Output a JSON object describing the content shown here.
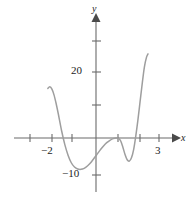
{
  "figure": {
    "name": "polynomial-graph",
    "background_color": "#ffffff"
  },
  "axes": {
    "x_axis": {
      "label": "x",
      "color": "#6b6b6b",
      "arrow": "right-arrow-icon"
    },
    "y_axis": {
      "label": "y",
      "color": "#6b6b6b",
      "arrow": "up-arrow-icon"
    },
    "origin_px": {
      "x": 96,
      "y": 138
    },
    "x_unit_px": 21.5,
    "y_unit_px": 3.3
  },
  "ticks": {
    "x": [
      {
        "value": -3,
        "label": "",
        "px": 30
      },
      {
        "value": -2,
        "label": "−2",
        "px": 52
      },
      {
        "value": -1,
        "label": "",
        "px": 72
      },
      {
        "value": 1,
        "label": "",
        "px": 118
      },
      {
        "value": 2,
        "label": "",
        "px": 140
      },
      {
        "value": 3,
        "label": "3",
        "px": 159
      }
    ],
    "y": [
      {
        "value": 30,
        "label": "",
        "px": 41
      },
      {
        "value": 20,
        "label": "20",
        "px": 72
      },
      {
        "value": 10,
        "label": "",
        "px": 105
      },
      {
        "value": -10,
        "label": "−10",
        "px": 175
      }
    ]
  },
  "labels": {
    "x_neg2": "−2",
    "x_3": "3",
    "y_20": "20",
    "y_neg10": "−10",
    "axis_x": "x",
    "axis_y": "y"
  },
  "chart_data": {
    "type": "line",
    "title": "",
    "xlabel": "x",
    "ylabel": "y",
    "xlim": [
      -2.3,
      2.5
    ],
    "ylim": [
      -12,
      28
    ],
    "grid": false,
    "legend": null,
    "curve_color": "#9e9e9e",
    "series": [
      {
        "name": "polynomial",
        "x": [
          -2.24,
          -2.15,
          -2.05,
          -1.95,
          -1.85,
          -1.75,
          -1.6,
          -1.45,
          -1.3,
          -1.15,
          -1.0,
          -0.85,
          -0.7,
          -0.55,
          -0.4,
          -0.25,
          -0.1,
          0.05,
          0.2,
          0.35,
          0.5,
          0.65,
          0.8,
          0.95,
          1.05,
          1.15,
          1.25,
          1.35,
          1.45,
          1.55,
          1.65,
          1.75,
          1.85,
          1.95,
          2.05,
          2.15,
          2.25,
          2.35,
          2.42
        ],
        "y": [
          15.0,
          15.5,
          14.8,
          13.0,
          10.3,
          7.2,
          2.2,
          -2.0,
          -5.2,
          -7.5,
          -8.8,
          -9.4,
          -9.5,
          -9.2,
          -8.5,
          -7.5,
          -6.2,
          -4.9,
          -3.6,
          -2.4,
          -1.4,
          -0.7,
          -0.2,
          0.0,
          -0.1,
          -0.9,
          -2.8,
          -5.0,
          -6.6,
          -7.0,
          -6.0,
          -3.5,
          0.6,
          5.5,
          11.0,
          16.5,
          21.5,
          24.5,
          25.5
        ]
      }
    ],
    "annotations": [
      {
        "text": "−2",
        "axis": "x",
        "value": -2
      },
      {
        "text": "3",
        "axis": "x",
        "value": 3
      },
      {
        "text": "20",
        "axis": "y",
        "value": 20
      },
      {
        "text": "−10",
        "axis": "y",
        "value": -10
      }
    ]
  }
}
